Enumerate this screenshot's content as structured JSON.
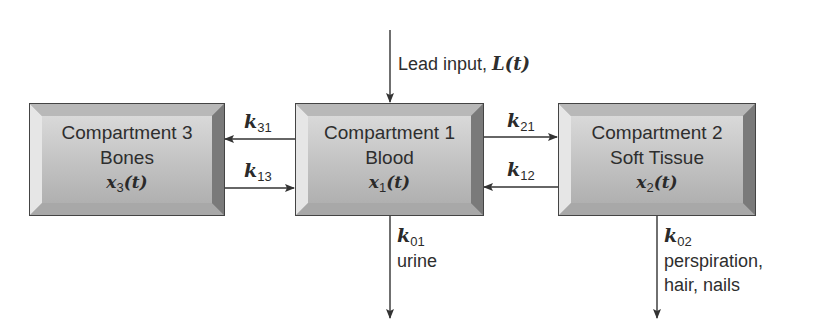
{
  "diagram": {
    "type": "compartment-model",
    "input": {
      "label": "Lead input, ",
      "math": "L(t)",
      "target": "compartment_1"
    },
    "compartments": [
      {
        "id": "compartment_3",
        "title": "Compartment 3",
        "name": "Bones",
        "var": "x",
        "var_sub": "3",
        "var_arg": "(t)"
      },
      {
        "id": "compartment_1",
        "title": "Compartment 1",
        "name": "Blood",
        "var": "x",
        "var_sub": "1",
        "var_arg": "(t)"
      },
      {
        "id": "compartment_2",
        "title": "Compartment 2",
        "name": "Soft Tissue",
        "var": "x",
        "var_sub": "2",
        "var_arg": "(t)"
      }
    ],
    "flows": [
      {
        "id": "k31",
        "k": "k",
        "sub": "31",
        "from": "compartment_1",
        "to": "compartment_3"
      },
      {
        "id": "k13",
        "k": "k",
        "sub": "13",
        "from": "compartment_3",
        "to": "compartment_1"
      },
      {
        "id": "k21",
        "k": "k",
        "sub": "21",
        "from": "compartment_1",
        "to": "compartment_2"
      },
      {
        "id": "k12",
        "k": "k",
        "sub": "12",
        "from": "compartment_2",
        "to": "compartment_1"
      },
      {
        "id": "k01",
        "k": "k",
        "sub": "01",
        "from": "compartment_1",
        "to": "outside",
        "desc": [
          "urine"
        ]
      },
      {
        "id": "k02",
        "k": "k",
        "sub": "02",
        "from": "compartment_2",
        "to": "outside",
        "desc": [
          "perspiration,",
          "hair, nails"
        ]
      }
    ],
    "colors": {
      "line": "#333333",
      "box_border": "#444444",
      "box_face": "#c4c4c4",
      "text": "#2e2e2e"
    }
  }
}
